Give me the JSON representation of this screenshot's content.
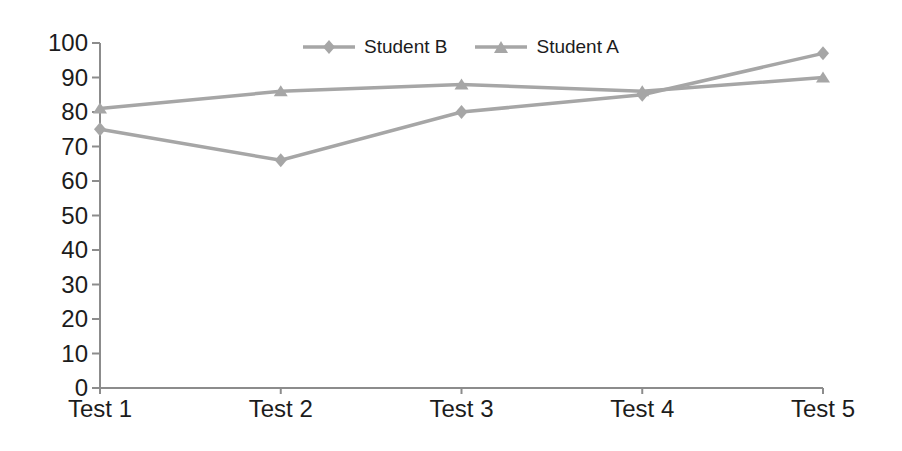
{
  "chart_data": {
    "type": "line",
    "title": "",
    "xlabel": "",
    "ylabel": "",
    "categories": [
      "Test 1",
      "Test 2",
      "Test 3",
      "Test 4",
      "Test 5"
    ],
    "series": [
      {
        "name": "Student B",
        "marker": "diamond",
        "values": [
          75,
          66,
          80,
          85,
          97
        ]
      },
      {
        "name": "Student A",
        "marker": "triangle",
        "values": [
          81,
          86,
          88,
          86,
          90
        ]
      }
    ],
    "ylim": [
      0,
      100
    ],
    "ytick_step": 10,
    "grid": false,
    "legend_position": "top-center",
    "colors": {
      "line": "#a6a6a6",
      "axis": "#8c8c8c",
      "text": "#1c1c1c",
      "background": "#ffffff"
    }
  }
}
